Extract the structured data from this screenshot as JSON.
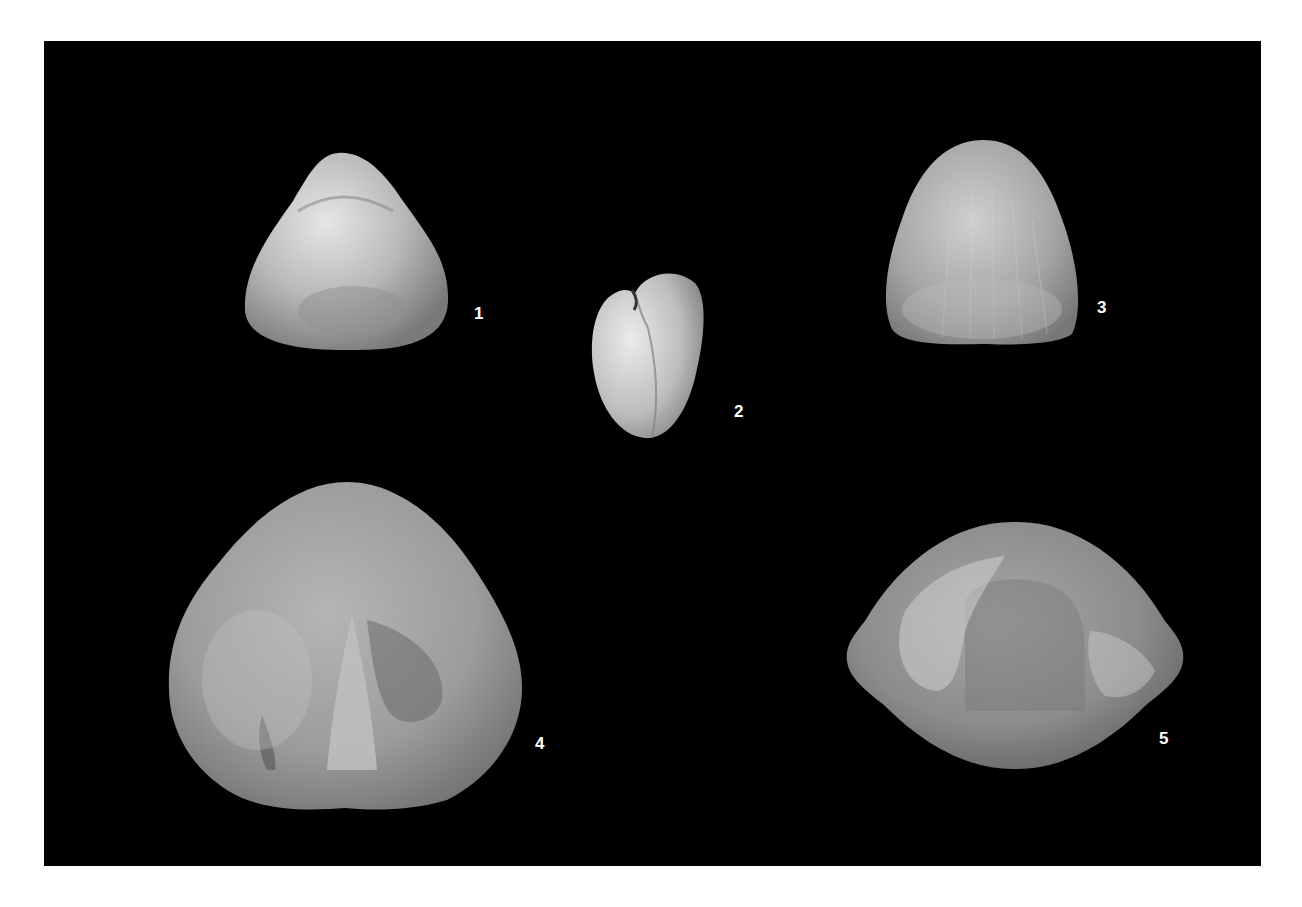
{
  "plate": {
    "background": "#000000",
    "page_background": "#ffffff",
    "figures": [
      {
        "label": "1",
        "description": "brachiopod shell, rounded-triangular, dorsal/ventral view"
      },
      {
        "label": "2",
        "description": "small brachiopod shell, heart-shaped, anterior view"
      },
      {
        "label": "3",
        "description": "brachiopod shell, bell-shaped with fine radial striae"
      },
      {
        "label": "4",
        "description": "large brachiopod shell with central spike-like structure"
      },
      {
        "label": "5",
        "description": "brachiopod shell, lenticular, wide lateral extremities"
      }
    ]
  }
}
